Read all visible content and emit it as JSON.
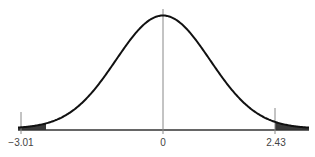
{
  "chart_data": {
    "type": "area",
    "title": "",
    "distribution": "standard normal",
    "xlabel": "",
    "ylabel": "",
    "x_ticks": [
      "-3.01",
      "0",
      "2.43"
    ],
    "x_tick_values": [
      -3.01,
      0,
      2.43
    ],
    "center_line": 0,
    "shaded_regions": [
      {
        "from": -3.2,
        "to": -3.01,
        "side": "left"
      },
      {
        "from": 2.43,
        "to": 3.5,
        "side": "right"
      }
    ],
    "xlim": [
      -3.2,
      3.5
    ],
    "grid": false,
    "legend": null
  },
  "colors": {
    "curve": "#111111",
    "shade": "#3a3a3a",
    "axis": "#333333",
    "markers": "#888888"
  },
  "labels": {
    "left_tick": "−3.01",
    "center_tick": "0",
    "right_tick": "2.43"
  }
}
